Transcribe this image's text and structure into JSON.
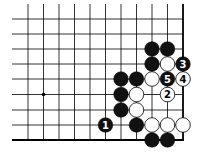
{
  "diagram": {
    "type": "go-board-diagram",
    "grid": {
      "cols_x": [
        28,
        43.5,
        59,
        74.5,
        90,
        105.5,
        121,
        136.5,
        152,
        167.5,
        183
      ],
      "rows_y": [
        19,
        34,
        49,
        64,
        79,
        94.5,
        110,
        125,
        140
      ],
      "edges": {
        "right": true,
        "bottom": true,
        "top": false,
        "left": false
      },
      "line_color": "#000000"
    },
    "star_points": [
      {
        "col": 1,
        "row": 5
      }
    ],
    "stones": [
      {
        "color": "black",
        "col": 8,
        "row": 2,
        "label": ""
      },
      {
        "color": "black",
        "col": 9,
        "row": 2,
        "label": ""
      },
      {
        "color": "black",
        "col": 8,
        "row": 3,
        "label": ""
      },
      {
        "color": "white",
        "col": 9,
        "row": 3,
        "label": ""
      },
      {
        "color": "black",
        "col": 10,
        "row": 3,
        "label": "3"
      },
      {
        "color": "black",
        "col": 6,
        "row": 4,
        "label": ""
      },
      {
        "color": "black",
        "col": 7,
        "row": 4,
        "label": ""
      },
      {
        "color": "white",
        "col": 8,
        "row": 4,
        "label": ""
      },
      {
        "color": "black",
        "col": 9,
        "row": 4,
        "label": "5"
      },
      {
        "color": "white",
        "col": 10,
        "row": 4,
        "label": "4"
      },
      {
        "color": "black",
        "col": 6,
        "row": 5,
        "label": ""
      },
      {
        "color": "white",
        "col": 7,
        "row": 5,
        "label": ""
      },
      {
        "color": "white",
        "col": 9,
        "row": 5,
        "label": "2"
      },
      {
        "color": "black",
        "col": 6,
        "row": 6,
        "label": ""
      },
      {
        "color": "white",
        "col": 7,
        "row": 6,
        "label": ""
      },
      {
        "color": "black",
        "col": 5,
        "row": 7,
        "label": "1"
      },
      {
        "color": "black",
        "col": 7,
        "row": 7,
        "label": ""
      },
      {
        "color": "white",
        "col": 8,
        "row": 7,
        "label": ""
      },
      {
        "color": "white",
        "col": 9,
        "row": 7,
        "label": ""
      },
      {
        "color": "white",
        "col": 10,
        "row": 7,
        "label": ""
      },
      {
        "color": "black",
        "col": 8,
        "row": 8,
        "label": ""
      },
      {
        "color": "black",
        "col": 9,
        "row": 8,
        "label": ""
      }
    ],
    "colors": {
      "black_stone": "#111111",
      "white_stone": "#ffffff",
      "stone_outline": "#000000"
    }
  }
}
